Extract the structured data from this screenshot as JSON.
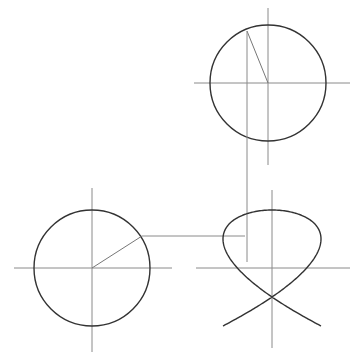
{
  "diagram": {
    "title": "",
    "colors": {
      "curve": "#333333",
      "axis": "#8a8a8a",
      "construction": "#8a8a8a",
      "background": "#ffffff"
    },
    "top_circle": {
      "cx": 268,
      "cy": 83,
      "r": 58,
      "radius_end": [
        247,
        31
      ]
    },
    "left_circle": {
      "cx": 92,
      "cy": 268,
      "r": 58,
      "radius_end": [
        142,
        236
      ]
    },
    "lissajous": {
      "cx": 272,
      "cy": 268,
      "ax": 49,
      "ay": 58,
      "freq_x": 3,
      "freq_y": 2
    },
    "projection_lines": {
      "vertical": {
        "x": 247,
        "y1": 31,
        "y2": 262
      },
      "horizontal": {
        "y": 236,
        "x1": 142,
        "x2": 245
      }
    }
  }
}
